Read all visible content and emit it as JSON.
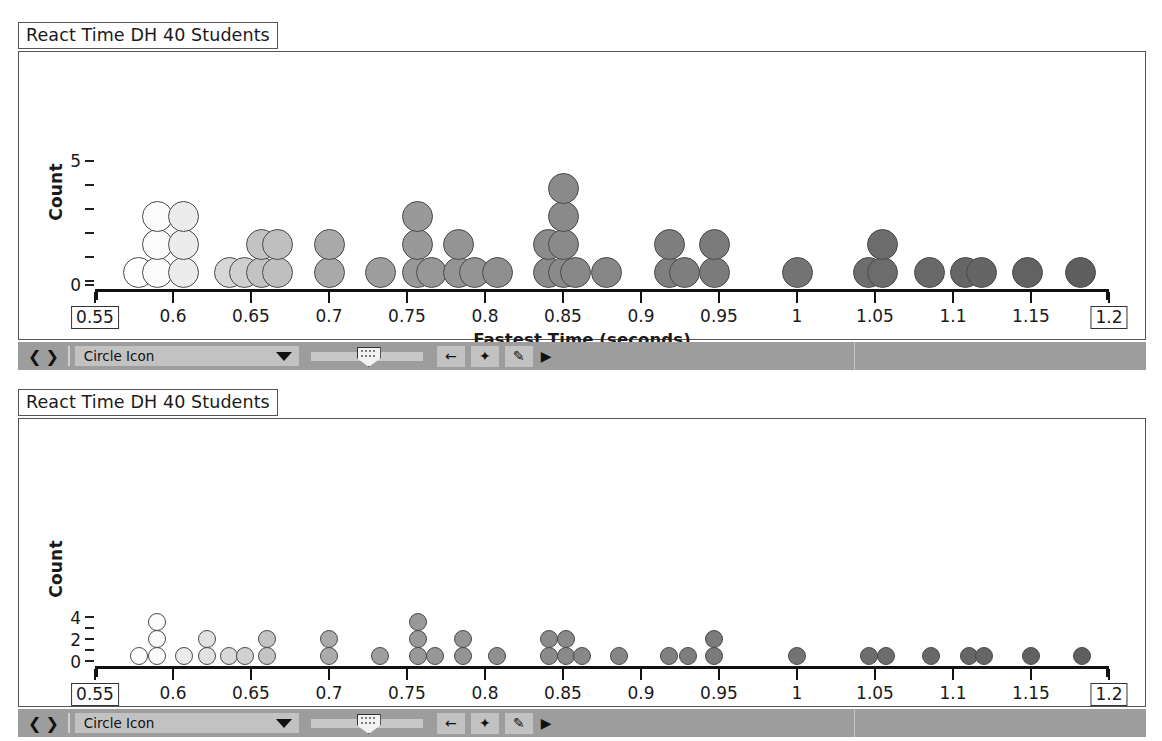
{
  "panels": [
    {
      "title": "React Time DH 40 Students",
      "ylabel": "Count",
      "xtitle": "Fastest Time (seconds)"
    },
    {
      "title": "React Time DH 40 Students",
      "ylabel": "Count",
      "xtitle": "Fastest Time (seconds)"
    }
  ],
  "toolbar": {
    "nav_prev": "❮",
    "nav_next": "❯",
    "select_value": "Circle Icon",
    "btn_back": "←",
    "btn_star": "✦",
    "btn_pencil": "✎",
    "btn_play": "▶"
  },
  "chart_data": [
    {
      "type": "scatter",
      "plot_kind": "dotplot",
      "title": "React Time DH 40 Students",
      "xlabel": "Fastest Time (seconds)",
      "ylabel": "Count",
      "xlim": [
        0.55,
        1.2
      ],
      "ylim": [
        0,
        5.6
      ],
      "yticks": [
        0,
        5
      ],
      "ytick_labels": [
        "0",
        "5"
      ],
      "ytick_minor_count": 6,
      "xticks": [
        0.55,
        0.6,
        0.65,
        0.7,
        0.75,
        0.8,
        0.85,
        0.9,
        0.95,
        1.0,
        1.05,
        1.1,
        1.15,
        1.2
      ],
      "xtick_labels": [
        "0.55",
        "0.6",
        "0.65",
        "0.7",
        "0.75",
        "0.8",
        "0.85",
        "0.9",
        "0.95",
        "1",
        "1.05",
        "1.1",
        "1.15",
        "1.2"
      ],
      "boxed_ticks": [
        "0.55",
        "1.2"
      ],
      "dot_size": "large",
      "grid": false,
      "legend": false,
      "stacks": [
        {
          "x": 0.578,
          "count": 1,
          "shade": "#ffffff"
        },
        {
          "x": 0.59,
          "count": 3,
          "shade": "#fbfbfb"
        },
        {
          "x": 0.607,
          "count": 3,
          "shade": "#ececec"
        },
        {
          "x": 0.636,
          "count": 1,
          "shade": "#d7d7d7"
        },
        {
          "x": 0.646,
          "count": 1,
          "shade": "#cfcfcf"
        },
        {
          "x": 0.657,
          "count": 2,
          "shade": "#c3c3c3"
        },
        {
          "x": 0.667,
          "count": 2,
          "shade": "#bfbfbf"
        },
        {
          "x": 0.7,
          "count": 2,
          "shade": "#a9a9a9"
        },
        {
          "x": 0.733,
          "count": 1,
          "shade": "#9e9e9e"
        },
        {
          "x": 0.757,
          "count": 3,
          "shade": "#999999"
        },
        {
          "x": 0.766,
          "count": 1,
          "shade": "#979797"
        },
        {
          "x": 0.783,
          "count": 2,
          "shade": "#949494"
        },
        {
          "x": 0.793,
          "count": 1,
          "shade": "#949494"
        },
        {
          "x": 0.808,
          "count": 1,
          "shade": "#8f8f8f"
        },
        {
          "x": 0.841,
          "count": 2,
          "shade": "#8b8b8b"
        },
        {
          "x": 0.85,
          "count": 4,
          "shade": "#8a8a8a"
        },
        {
          "x": 0.858,
          "count": 1,
          "shade": "#888888"
        },
        {
          "x": 0.878,
          "count": 1,
          "shade": "#868686"
        },
        {
          "x": 0.918,
          "count": 2,
          "shade": "#7f7f7f"
        },
        {
          "x": 0.928,
          "count": 1,
          "shade": "#7e7e7e"
        },
        {
          "x": 0.947,
          "count": 2,
          "shade": "#7b7b7b"
        },
        {
          "x": 1.0,
          "count": 1,
          "shade": "#737373"
        },
        {
          "x": 1.046,
          "count": 1,
          "shade": "#6d6d6d"
        },
        {
          "x": 1.055,
          "count": 2,
          "shade": "#6c6c6c"
        },
        {
          "x": 1.085,
          "count": 1,
          "shade": "#696969"
        },
        {
          "x": 1.108,
          "count": 1,
          "shade": "#666666"
        },
        {
          "x": 1.118,
          "count": 1,
          "shade": "#656565"
        },
        {
          "x": 1.148,
          "count": 1,
          "shade": "#626262"
        },
        {
          "x": 1.182,
          "count": 1,
          "shade": "#5e5e5e"
        }
      ]
    },
    {
      "type": "scatter",
      "plot_kind": "dotplot",
      "title": "React Time DH 40 Students",
      "xlabel": "Fastest Time (seconds)",
      "ylabel": "Count",
      "xlim": [
        0.55,
        1.2
      ],
      "ylim": [
        0,
        11
      ],
      "yticks": [
        0,
        2,
        4
      ],
      "ytick_labels": [
        "0",
        "2",
        "4"
      ],
      "xticks": [
        0.55,
        0.6,
        0.65,
        0.7,
        0.75,
        0.8,
        0.85,
        0.9,
        0.95,
        1.0,
        1.05,
        1.1,
        1.15,
        1.2
      ],
      "xtick_labels": [
        "0.55",
        "0.6",
        "0.65",
        "0.7",
        "0.75",
        "0.8",
        "0.85",
        "0.9",
        "0.95",
        "1",
        "1.05",
        "1.1",
        "1.15",
        "1.2"
      ],
      "boxed_ticks": [
        "0.55",
        "1.2"
      ],
      "dot_size": "small",
      "grid": false,
      "legend": false,
      "stacks": [
        {
          "x": 0.578,
          "count": 1,
          "shade": "#ffffff"
        },
        {
          "x": 0.59,
          "count": 3,
          "shade": "#fbfbfb"
        },
        {
          "x": 0.607,
          "count": 1,
          "shade": "#ececec"
        },
        {
          "x": 0.622,
          "count": 2,
          "shade": "#e2e2e2"
        },
        {
          "x": 0.636,
          "count": 1,
          "shade": "#d9d9d9"
        },
        {
          "x": 0.646,
          "count": 1,
          "shade": "#d2d2d2"
        },
        {
          "x": 0.66,
          "count": 2,
          "shade": "#c4c4c4"
        },
        {
          "x": 0.7,
          "count": 2,
          "shade": "#ababab"
        },
        {
          "x": 0.733,
          "count": 1,
          "shade": "#9e9e9e"
        },
        {
          "x": 0.757,
          "count": 3,
          "shade": "#999999"
        },
        {
          "x": 0.768,
          "count": 1,
          "shade": "#979797"
        },
        {
          "x": 0.786,
          "count": 2,
          "shade": "#949494"
        },
        {
          "x": 0.808,
          "count": 1,
          "shade": "#909090"
        },
        {
          "x": 0.841,
          "count": 2,
          "shade": "#8b8b8b"
        },
        {
          "x": 0.852,
          "count": 2,
          "shade": "#8a8a8a"
        },
        {
          "x": 0.862,
          "count": 1,
          "shade": "#888888"
        },
        {
          "x": 0.886,
          "count": 1,
          "shade": "#858585"
        },
        {
          "x": 0.918,
          "count": 1,
          "shade": "#808080"
        },
        {
          "x": 0.93,
          "count": 1,
          "shade": "#7e7e7e"
        },
        {
          "x": 0.947,
          "count": 2,
          "shade": "#7b7b7b"
        },
        {
          "x": 1.0,
          "count": 1,
          "shade": "#737373"
        },
        {
          "x": 1.046,
          "count": 1,
          "shade": "#6d6d6d"
        },
        {
          "x": 1.057,
          "count": 1,
          "shade": "#6c6c6c"
        },
        {
          "x": 1.086,
          "count": 1,
          "shade": "#686868"
        },
        {
          "x": 1.11,
          "count": 1,
          "shade": "#666666"
        },
        {
          "x": 1.12,
          "count": 1,
          "shade": "#656565"
        },
        {
          "x": 1.15,
          "count": 1,
          "shade": "#616161"
        },
        {
          "x": 1.183,
          "count": 1,
          "shade": "#5e5e5e"
        }
      ]
    }
  ]
}
